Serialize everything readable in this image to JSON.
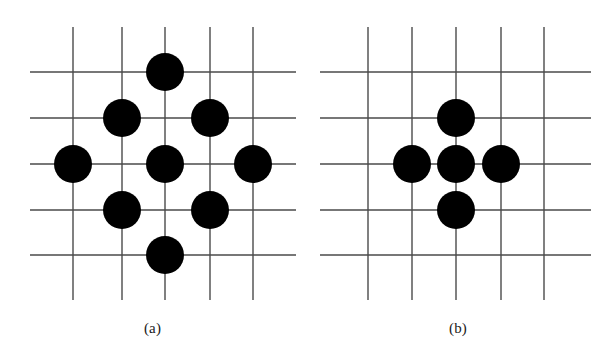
{
  "figure": {
    "background_color": "#ffffff",
    "dot_color": "#000000",
    "grid_color": "#4a4a4a",
    "grid_line_width": 1.4,
    "dot_radius": 19,
    "width": 611,
    "height": 362
  },
  "panels": [
    {
      "id": "a",
      "caption": "(a)",
      "dot_count": 9,
      "grid": {
        "vertical_x": [
          73,
          122,
          165,
          210,
          253
        ],
        "horizontal_y": [
          72,
          118,
          164,
          210,
          255
        ],
        "x_extent": [
          30,
          296
        ],
        "y_extent": [
          27,
          300
        ]
      },
      "dots": [
        {
          "name": "dot-top",
          "cx": 165,
          "cy": 72,
          "r": 19
        },
        {
          "name": "dot-upper-left",
          "cx": 122,
          "cy": 118,
          "r": 19
        },
        {
          "name": "dot-upper-right",
          "cx": 210,
          "cy": 118,
          "r": 19
        },
        {
          "name": "dot-left",
          "cx": 73,
          "cy": 164,
          "r": 19
        },
        {
          "name": "dot-center",
          "cx": 165,
          "cy": 164,
          "r": 19
        },
        {
          "name": "dot-right",
          "cx": 253,
          "cy": 164,
          "r": 19
        },
        {
          "name": "dot-lower-left",
          "cx": 122,
          "cy": 210,
          "r": 19
        },
        {
          "name": "dot-lower-right",
          "cx": 210,
          "cy": 210,
          "r": 19
        },
        {
          "name": "dot-bottom",
          "cx": 165,
          "cy": 255,
          "r": 19
        }
      ]
    },
    {
      "id": "b",
      "caption": "(b)",
      "dot_count": 5,
      "grid": {
        "vertical_x": [
          63,
          107,
          151,
          196,
          239
        ],
        "horizontal_y": [
          72,
          118,
          164,
          210,
          255
        ],
        "x_extent": [
          15,
          286
        ],
        "y_extent": [
          27,
          300
        ]
      },
      "dots": [
        {
          "name": "dot-top",
          "cx": 151,
          "cy": 118,
          "r": 19
        },
        {
          "name": "dot-left",
          "cx": 107,
          "cy": 164,
          "r": 19
        },
        {
          "name": "dot-center",
          "cx": 151,
          "cy": 164,
          "r": 19
        },
        {
          "name": "dot-right",
          "cx": 196,
          "cy": 164,
          "r": 19
        },
        {
          "name": "dot-bottom",
          "cx": 151,
          "cy": 210,
          "r": 19
        }
      ]
    }
  ]
}
